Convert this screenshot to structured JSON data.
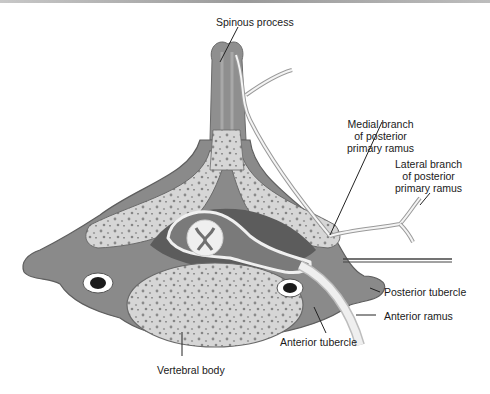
{
  "figure": {
    "labels": {
      "spinous_process": "Spinous process",
      "medial_branch": [
        "Medial branch",
        "of posterior",
        "primary ramus"
      ],
      "lateral_branch": [
        "Lateral branch",
        "of posterior",
        "primary ramus"
      ],
      "posterior_tubercle": "Posterior tubercle",
      "anterior_ramus": "Anterior ramus",
      "anterior_tubercle": "Anterior tubercle",
      "vertebral_body": "Vertebral body"
    },
    "colors": {
      "bone_outer": "#8c8c8c",
      "bone_dark": "#6e6e6e",
      "cancellous": "#d4d4d4",
      "canal": "#5a5a5a",
      "nerve": "#f2f2f2",
      "leader_line": "#222222"
    }
  }
}
